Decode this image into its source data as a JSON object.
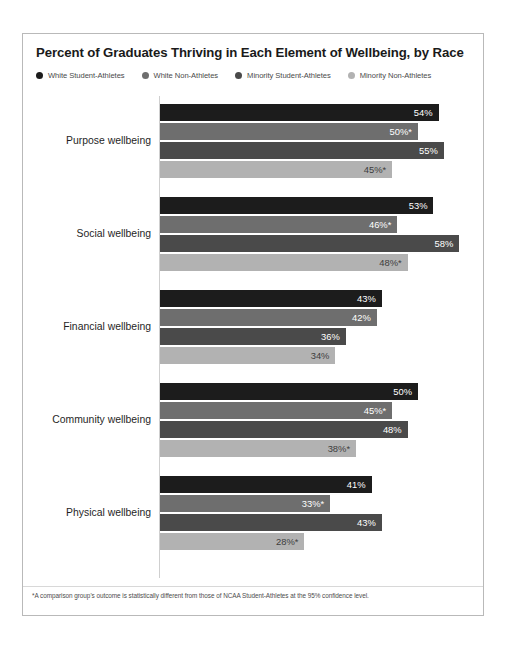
{
  "chart_data": {
    "type": "bar",
    "orientation": "horizontal",
    "title": "Percent of Graduates Thriving in Each Element of Wellbeing, by Race",
    "xlabel": "",
    "ylabel": "",
    "xlim": [
      0,
      58
    ],
    "grid": false,
    "legend_position": "top-left",
    "categories": [
      "Purpose wellbeing",
      "Social wellbeing",
      "Financial wellbeing",
      "Community wellbeing",
      "Physical wellbeing"
    ],
    "series": [
      {
        "name": "White Student-Athletes",
        "color": "#1c1c1c",
        "values": [
          54,
          53,
          43,
          50,
          41
        ],
        "labels": [
          "54%",
          "53%",
          "43%",
          "50%",
          "41%"
        ]
      },
      {
        "name": "White Non-Athletes",
        "color": "#6e6e6e",
        "values": [
          50,
          46,
          42,
          45,
          33
        ],
        "labels": [
          "50%*",
          "46%*",
          "42%",
          "45%*",
          "33%*"
        ]
      },
      {
        "name": "Minority Student-Athletes",
        "color": "#4a4a4a",
        "values": [
          55,
          58,
          36,
          48,
          43
        ],
        "labels": [
          "55%",
          "58%",
          "36%",
          "48%",
          "43%"
        ]
      },
      {
        "name": "Minority Non-Athletes",
        "color": "#b2b2b2",
        "values": [
          45,
          48,
          34,
          38,
          28
        ],
        "labels": [
          "45%*",
          "48%*",
          "34%",
          "38%*",
          "28%*"
        ]
      }
    ],
    "footnote": "*A comparison group's outcome is statistically different from those of NCAA Student-Athletes at the 95% confidence level."
  },
  "legend": [
    {
      "label": "White Student-Athletes",
      "color": "#1c1c1c"
    },
    {
      "label": "White Non-Athletes",
      "color": "#6e6e6e"
    },
    {
      "label": "Minority Student-Athletes",
      "color": "#4a4a4a"
    },
    {
      "label": "Minority Non-Athletes",
      "color": "#b2b2b2"
    }
  ]
}
